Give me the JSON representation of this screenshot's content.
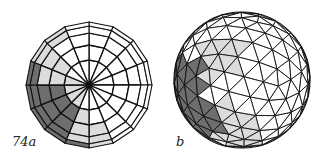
{
  "figure": {
    "labels": {
      "a": "74a",
      "b": "b"
    },
    "colors": {
      "background": "#ffffff",
      "line": "#111111",
      "face_white": "#ffffff",
      "face_light": "#dcdcdc",
      "face_dark": "#6e6e6e"
    },
    "sphere_a": {
      "description": "Polar view of a UV-style polyhedral sphere with 16 meridians and concentric latitude rings",
      "center": [
        89,
        85
      ],
      "radius": 63,
      "meridians": 16,
      "ring_radii": [
        0,
        25,
        40,
        52,
        59,
        63
      ],
      "shaded_cells": [
        {
          "sector": 8,
          "ring": 1,
          "shade": "light"
        },
        {
          "sector": 8,
          "ring": 2,
          "shade": "light"
        },
        {
          "sector": 8,
          "ring": 3,
          "shade": "light"
        },
        {
          "sector": 8,
          "ring": 4,
          "shade": "dark"
        },
        {
          "sector": 7,
          "ring": 2,
          "shade": "light"
        },
        {
          "sector": 7,
          "ring": 3,
          "shade": "light"
        },
        {
          "sector": 7,
          "ring": 4,
          "shade": "light"
        },
        {
          "sector": 9,
          "ring": 0,
          "shade": "light"
        },
        {
          "sector": 9,
          "ring": 1,
          "shade": "dark"
        },
        {
          "sector": 9,
          "ring": 2,
          "shade": "dark"
        },
        {
          "sector": 9,
          "ring": 3,
          "shade": "dark"
        },
        {
          "sector": 9,
          "ring": 4,
          "shade": "dark"
        },
        {
          "sector": 10,
          "ring": 0,
          "shade": "light"
        },
        {
          "sector": 10,
          "ring": 1,
          "shade": "dark"
        },
        {
          "sector": 10,
          "ring": 2,
          "shade": "dark"
        },
        {
          "sector": 10,
          "ring": 3,
          "shade": "dark"
        },
        {
          "sector": 10,
          "ring": 4,
          "shade": "dark"
        },
        {
          "sector": 11,
          "ring": 0,
          "shade": "light"
        },
        {
          "sector": 11,
          "ring": 1,
          "shade": "dark"
        },
        {
          "sector": 11,
          "ring": 2,
          "shade": "dark"
        },
        {
          "sector": 11,
          "ring": 3,
          "shade": "dark"
        },
        {
          "sector": 11,
          "ring": 4,
          "shade": "dark"
        },
        {
          "sector": 12,
          "ring": 0,
          "shade": "light"
        },
        {
          "sector": 12,
          "ring": 1,
          "shade": "light"
        },
        {
          "sector": 12,
          "ring": 2,
          "shade": "light"
        },
        {
          "sector": 12,
          "ring": 3,
          "shade": "dark"
        },
        {
          "sector": 12,
          "ring": 4,
          "shade": "dark"
        },
        {
          "sector": 13,
          "ring": 1,
          "shade": "light"
        },
        {
          "sector": 13,
          "ring": 2,
          "shade": "light"
        },
        {
          "sector": 13,
          "ring": 3,
          "shade": "light"
        },
        {
          "sector": 13,
          "ring": 4,
          "shade": "light"
        },
        {
          "sector": 14,
          "ring": 3,
          "shade": "light"
        },
        {
          "sector": 14,
          "ring": 4,
          "shade": "light"
        }
      ]
    },
    "sphere_b": {
      "description": "Geodesic sphere triangulated from an icosahedron, viewed obliquely",
      "center": [
        242,
        80
      ],
      "radius": 68,
      "subdivision": 4,
      "rotation_deg": [
        18,
        -28,
        8
      ]
    }
  }
}
